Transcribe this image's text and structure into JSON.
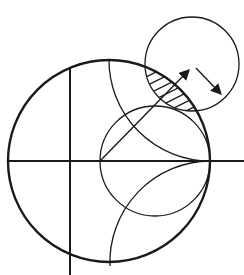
{
  "diagram": {
    "type": "smith-chart-stability-circle",
    "colors": {
      "stroke": "#1a1a1a",
      "background": "#ffffff"
    },
    "elements": [
      "unit-circle",
      "real-axis",
      "imaginary-axis",
      "constant-resistance-circle",
      "positive-reactance-arc",
      "negative-reactance-arc",
      "stability-circle",
      "unstable-region-hatch",
      "radius-vector-arrow",
      "radius-arrow"
    ]
  }
}
